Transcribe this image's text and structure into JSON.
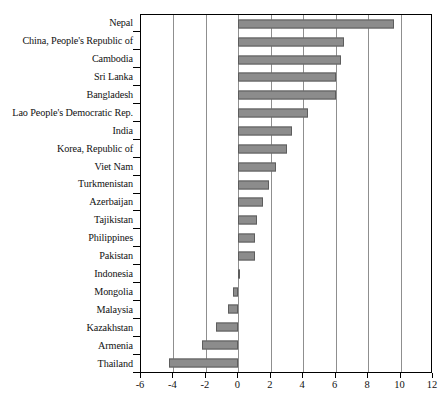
{
  "chart_data": {
    "type": "bar",
    "orientation": "horizontal",
    "title": "",
    "xlabel": "",
    "ylabel": "",
    "xlim": [
      -6,
      12
    ],
    "xticks": [
      -6,
      -4,
      -2,
      0,
      2,
      4,
      6,
      8,
      10,
      12
    ],
    "xtick_labels": [
      "-6",
      "-4",
      "-2",
      "0",
      "2",
      "4",
      "6",
      "8",
      "10",
      "12"
    ],
    "grid": true,
    "legend": false,
    "bar_color": "#8c8c8c",
    "bar_border_color": "#5d5d5d",
    "categories": [
      "Nepal",
      "China, People's Republic of",
      "Cambodia",
      "Sri Lanka",
      "Bangladesh",
      "Lao People's Democratic Rep.",
      "India",
      "Korea, Republic of",
      "Viet Nam",
      "Turkmenistan",
      "Azerbaijan",
      "Tajikistan",
      "Philippines",
      "Pakistan",
      "Indonesia",
      "Mongolia",
      "Malaysia",
      "Kazakhstan",
      "Armenia",
      "Thailand"
    ],
    "values": [
      9.6,
      6.5,
      6.35,
      6.0,
      6.05,
      4.3,
      3.3,
      3.0,
      2.3,
      1.9,
      1.55,
      1.15,
      1.0,
      1.05,
      0.05,
      -0.35,
      -0.65,
      -1.35,
      -2.25,
      -4.3
    ]
  }
}
